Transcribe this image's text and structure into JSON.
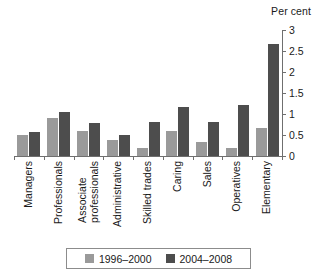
{
  "chart_data": {
    "type": "bar",
    "title": "",
    "subtitle": "",
    "unit_label": "Per cent",
    "xlabel": "",
    "ylabel": "Per cent",
    "ylim": [
      0,
      3
    ],
    "yticks": [
      "0",
      "0.5",
      "1",
      "1.5",
      "2",
      "2.5",
      "3"
    ],
    "ytick_values": [
      0,
      0.5,
      1,
      1.5,
      2,
      2.5,
      3
    ],
    "grid": false,
    "y_axis_position": "right",
    "legend_position": "bottom",
    "categories": [
      "Managers",
      "Professionals",
      "Associate professionals",
      "Administrative",
      "Skilled trades",
      "Caring",
      "Sales",
      "Operatives",
      "Elementary"
    ],
    "category_lines": [
      [
        "Managers",
        ""
      ],
      [
        "Professionals",
        ""
      ],
      [
        "Associate",
        "professionals"
      ],
      [
        "Administrative",
        ""
      ],
      [
        "Skilled trades",
        ""
      ],
      [
        "Caring",
        ""
      ],
      [
        "Sales",
        ""
      ],
      [
        "Operatives",
        ""
      ],
      [
        "Elementary",
        ""
      ]
    ],
    "series": [
      {
        "name": "1996–2000",
        "color": "#9a9a9a",
        "values": [
          0.5,
          0.9,
          0.6,
          0.37,
          0.19,
          0.6,
          0.33,
          0.19,
          0.67
        ]
      },
      {
        "name": "2004–2008",
        "color": "#4d4d4d",
        "values": [
          0.58,
          1.05,
          0.78,
          0.5,
          0.8,
          1.17,
          0.82,
          1.21,
          2.67
        ]
      }
    ]
  },
  "legend": {
    "items": [
      {
        "label": "1996–2000",
        "color": "#9a9a9a"
      },
      {
        "label": "2004–2008",
        "color": "#4d4d4d"
      }
    ]
  },
  "colors": {
    "series_1996_2000": "#9a9a9a",
    "series_2004_2008": "#4d4d4d",
    "axis": "#6f6f6f",
    "text": "#1a1a1a",
    "background": "#ffffff"
  }
}
